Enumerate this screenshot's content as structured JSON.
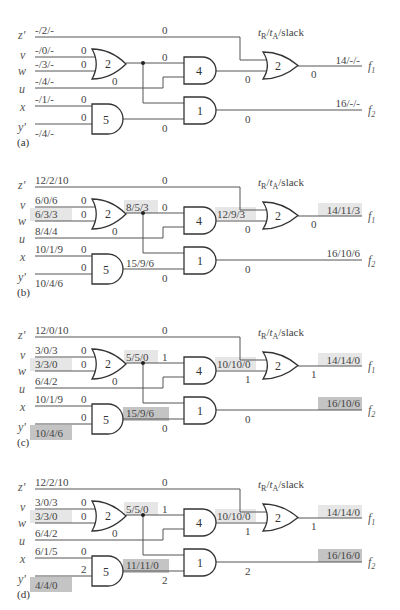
{
  "legend": {
    "header": "t_R/t_A/slack"
  },
  "colors": {
    "highlight_light": "#e6e6e6",
    "highlight_dark": "#c4c4c4",
    "wire": "#555555"
  },
  "inputs": [
    "z'",
    "v",
    "w",
    "u",
    "x",
    "y'"
  ],
  "outputs": [
    "f1",
    "f2"
  ],
  "gates": [
    {
      "id": "or2_in",
      "type": "OR",
      "delay": "2"
    },
    {
      "id": "and5",
      "type": "AND",
      "delay": "5"
    },
    {
      "id": "and4",
      "type": "AND",
      "delay": "4"
    },
    {
      "id": "and1",
      "type": "AND",
      "delay": "1"
    },
    {
      "id": "or2_out",
      "type": "OR",
      "delay": "2"
    }
  ],
  "panels": [
    {
      "label": "(a)",
      "in_z": "-/2/-",
      "in_v": "-/0/-",
      "in_w": "-/3/-",
      "in_u": "-/4/-",
      "in_x": "-/1/-",
      "in_y": "-/4/-",
      "sl_z": "0",
      "sl_v": "0",
      "sl_w": "0",
      "sl_u": "0",
      "sl_x": "0",
      "sl_y": "0",
      "mid_or": "",
      "sl_or_to4": "0",
      "mid_and5": "",
      "sl_and5": "0",
      "mid_and4": "",
      "sl_and4": "0",
      "sl_out1": "0",
      "sl_and1": "0",
      "out_f1": "14/-/-",
      "out_f2": "16/-/-",
      "hl": {
        "w": false,
        "y": false,
        "or": false,
        "and5": false,
        "and4": false,
        "f1": false,
        "f2": false
      }
    },
    {
      "label": "(b)",
      "in_z": "12/2/10",
      "in_v": "6/0/6",
      "in_w": "6/3/3",
      "in_u": "8/4/4",
      "in_x": "10/1/9",
      "in_y": "10/4/6",
      "sl_z": "0",
      "sl_v": "0",
      "sl_w": "0",
      "sl_u": "0",
      "sl_x": "0",
      "sl_y": "0",
      "mid_or": "8/5/3",
      "sl_or_to4": "0",
      "mid_and5": "15/9/6",
      "sl_and5": "0",
      "mid_and4": "12/9/3",
      "sl_and4": "0",
      "sl_out1": "0",
      "sl_and1": "0",
      "out_f1": "14/11/3",
      "out_f2": "16/10/6",
      "hl": {
        "w": "light",
        "y": false,
        "or": "light",
        "and5": false,
        "and4": "light",
        "f1": "light",
        "f2": false
      }
    },
    {
      "label": "(c)",
      "in_z": "12/0/10",
      "in_v": "3/0/3",
      "in_w": "3/3/0",
      "in_u": "6/4/2",
      "in_x": "10/1/9",
      "in_y": "10/4/6",
      "sl_z": "0",
      "sl_v": "0",
      "sl_w": "0",
      "sl_u": "0",
      "sl_x": "0",
      "sl_y": "0",
      "mid_or": "5/5/0",
      "sl_or_to4": "1",
      "mid_and5": "15/9/6",
      "sl_and5": "0",
      "mid_and4": "10/10/0",
      "sl_and4": "1",
      "sl_out1": "1",
      "sl_and1": "0",
      "out_f1": "14/14/0",
      "out_f2": "16/10/6",
      "hl": {
        "w": "light",
        "y": "dark",
        "or": "light",
        "and5": "dark",
        "and4": "light",
        "f1": "light",
        "f2": "dark"
      }
    },
    {
      "label": "(d)",
      "in_z": "12/2/10",
      "in_v": "3/0/3",
      "in_w": "3/3/0",
      "in_u": "6/4/2",
      "in_x": "6/1/5",
      "in_y": "4/4/0",
      "sl_z": "0",
      "sl_v": "0",
      "sl_w": "0",
      "sl_u": "0",
      "sl_x": "0",
      "sl_y": "2",
      "mid_or": "5/5/0",
      "sl_or_to4": "1",
      "mid_and5": "11/11/0",
      "sl_and5": "2",
      "mid_and4": "10/10/0",
      "sl_and4": "1",
      "sl_out1": "1",
      "sl_and1": "2",
      "out_f1": "14/14/0",
      "out_f2": "16/16/0",
      "hl": {
        "w": "light",
        "y": "dark",
        "or": "light",
        "and5": "dark",
        "and4": "light",
        "f1": "light",
        "f2": "dark"
      }
    }
  ]
}
